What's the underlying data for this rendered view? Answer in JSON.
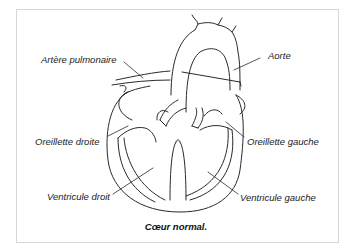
{
  "figure": {
    "caption": "Cœur normal.",
    "labels": {
      "artere_pulmonaire": "Artère pulmonaire",
      "aorte": "Aorte",
      "oreillette_droite": "Oreillette droite",
      "oreillette_gauche": "Oreillette gauche",
      "ventricule_droit": "Ventricule droit",
      "ventricule_gauche": "Ventricule gauche"
    },
    "colors": {
      "line": "#2a2a2a",
      "frame": "#d6d6d6",
      "text": "#222222"
    }
  }
}
